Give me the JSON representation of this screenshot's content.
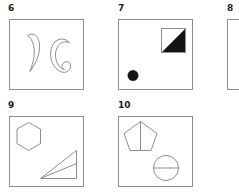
{
  "sheet": {
    "background_color": "#ffffff",
    "stroke_color": "#8d8d8d",
    "fill_color": "#141414",
    "label_color": "#1b1b1b"
  },
  "panels": [
    {
      "number": "6",
      "number_x": 8,
      "number_y": 4,
      "box": {
        "x": 9,
        "y": 19,
        "w": 75,
        "h": 71
      },
      "cropped": false,
      "shapes": [
        {
          "name": "crescent-comma-shape",
          "kind": "crescent",
          "position": "left"
        },
        {
          "name": "crescent-c-shape",
          "kind": "crescent",
          "position": "right"
        }
      ]
    },
    {
      "number": "7",
      "number_x": 118,
      "number_y": 4,
      "box": {
        "x": 118,
        "y": 19,
        "w": 75,
        "h": 71
      },
      "cropped": false,
      "shapes": [
        {
          "name": "half-filled-square-shape",
          "kind": "square-diagonal-filled",
          "position": "top-right"
        },
        {
          "name": "filled-circle-shape",
          "kind": "disc",
          "position": "bottom-left"
        }
      ]
    },
    {
      "number": "8",
      "number_x": 227,
      "number_y": 4,
      "box": {
        "x": 227,
        "y": 19,
        "w": 75,
        "h": 71
      },
      "cropped": true,
      "shapes": []
    },
    {
      "number": "9",
      "number_x": 8,
      "number_y": 101,
      "box": {
        "x": 9,
        "y": 116,
        "w": 75,
        "h": 71
      },
      "cropped": false,
      "shapes": [
        {
          "name": "hexagon-shape",
          "kind": "hexagon",
          "position": "top-left"
        },
        {
          "name": "right-triangle-shape",
          "kind": "triangle-with-median",
          "position": "bottom-right"
        }
      ]
    },
    {
      "number": "10",
      "number_x": 118,
      "number_y": 101,
      "box": {
        "x": 118,
        "y": 116,
        "w": 75,
        "h": 71
      },
      "cropped": false,
      "shapes": [
        {
          "name": "pentagon-shape",
          "kind": "pentagon-with-vertical-line",
          "position": "top-left"
        },
        {
          "name": "divided-circle-shape",
          "kind": "circle-with-horizontal-line",
          "position": "bottom-right"
        }
      ]
    }
  ]
}
